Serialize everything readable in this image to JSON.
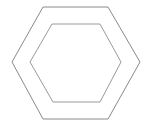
{
  "diagram": {
    "type": "nested-hexagons",
    "shapes": [
      {
        "name": "outer-hexagon",
        "kind": "hexagon",
        "color": "#8a8a8a"
      },
      {
        "name": "inner-hexagon",
        "kind": "hexagon",
        "color": "#9a9a9a"
      }
    ],
    "background": "#ffffff"
  }
}
